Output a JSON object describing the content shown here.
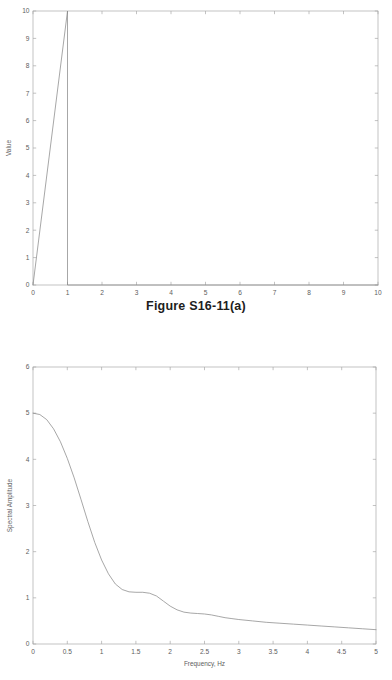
{
  "page": {
    "width": 392,
    "height": 680,
    "background": "#ffffff",
    "line_color": "#8a8a8a",
    "axis_color": "#a9a9a9",
    "text_color": "#5d5d5d",
    "caption_color": "#1d1d1d"
  },
  "figures": [
    {
      "id": "figure-top",
      "caption": "Figure S16-11(a)"
    },
    {
      "id": "figure-bottom",
      "caption": ""
    }
  ],
  "chart_data": [
    {
      "type": "line",
      "title": "Figure S16-11(a)",
      "xlabel": "",
      "ylabel": "Value",
      "xlim": [
        0,
        10
      ],
      "ylim": [
        0,
        10
      ],
      "xticks": [
        0,
        1,
        2,
        3,
        4,
        5,
        6,
        7,
        8,
        9,
        10
      ],
      "xtick_labels": [
        "0",
        "1",
        "2",
        "3",
        "4",
        "5",
        "6",
        "7",
        "8",
        "9",
        "10"
      ],
      "yticks": [
        0,
        1,
        2,
        3,
        4,
        5,
        6,
        7,
        8,
        9,
        10
      ],
      "ytick_labels": [
        "0",
        "1",
        "2",
        "3",
        "4",
        "5",
        "6",
        "7",
        "8",
        "9",
        "10"
      ],
      "grid": false,
      "legend": null,
      "series": [
        {
          "name": "sawtooth pulse",
          "x": [
            0,
            1,
            1,
            10
          ],
          "y": [
            0,
            10,
            0,
            0
          ]
        }
      ]
    },
    {
      "type": "line",
      "title": "",
      "xlabel": "Frequency, Hz",
      "ylabel": "Spectral Amplitude",
      "xlim": [
        0,
        5
      ],
      "ylim": [
        0,
        6
      ],
      "xticks": [
        0,
        0.5,
        1,
        1.5,
        2,
        2.5,
        3,
        3.5,
        4,
        4.5,
        5
      ],
      "xtick_labels": [
        "0",
        "0.5",
        "1",
        "1.5",
        "2",
        "2.5",
        "3",
        "3.5",
        "4",
        "4.5",
        "5"
      ],
      "yticks": [
        0,
        1,
        2,
        3,
        4,
        5,
        6
      ],
      "ytick_labels": [
        "0",
        "1",
        "2",
        "3",
        "4",
        "5",
        "6"
      ],
      "grid": false,
      "legend": null,
      "series": [
        {
          "name": "Spectral Amplitude",
          "x": [
            0,
            0.1,
            0.2,
            0.3,
            0.4,
            0.5,
            0.6,
            0.7,
            0.8,
            0.9,
            1.0,
            1.1,
            1.2,
            1.3,
            1.4,
            1.5,
            1.6,
            1.7,
            1.8,
            1.9,
            2.0,
            2.1,
            2.2,
            2.3,
            2.4,
            2.5,
            2.6,
            2.7,
            2.8,
            2.9,
            3.0,
            3.2,
            3.4,
            3.6,
            3.8,
            4.0,
            4.2,
            4.4,
            4.6,
            4.8,
            5.0
          ],
          "y": [
            5.0,
            4.97,
            4.86,
            4.66,
            4.38,
            4.02,
            3.6,
            3.13,
            2.65,
            2.2,
            1.82,
            1.52,
            1.3,
            1.18,
            1.13,
            1.12,
            1.12,
            1.1,
            1.04,
            0.93,
            0.82,
            0.74,
            0.69,
            0.67,
            0.66,
            0.65,
            0.63,
            0.6,
            0.57,
            0.55,
            0.53,
            0.5,
            0.47,
            0.45,
            0.43,
            0.41,
            0.39,
            0.37,
            0.35,
            0.33,
            0.31
          ]
        }
      ]
    }
  ]
}
